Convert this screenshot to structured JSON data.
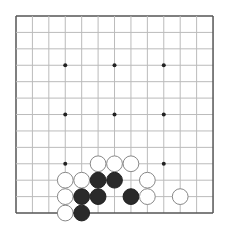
{
  "board": {
    "size": 13,
    "origin": {
      "x": 16,
      "y": 16
    },
    "spacing": 16.42,
    "line_color": "#bbbbbb",
    "border_color": "#555555",
    "star_points": [
      [
        3,
        3
      ],
      [
        6,
        3
      ],
      [
        9,
        3
      ],
      [
        3,
        6
      ],
      [
        6,
        6
      ],
      [
        9,
        6
      ],
      [
        3,
        9
      ],
      [
        6,
        9
      ],
      [
        9,
        9
      ]
    ],
    "stones": [
      {
        "color": "white",
        "col": 5,
        "row": 9
      },
      {
        "color": "white",
        "col": 6,
        "row": 9
      },
      {
        "color": "white",
        "col": 7,
        "row": 9
      },
      {
        "color": "white",
        "col": 3,
        "row": 10
      },
      {
        "color": "white",
        "col": 4,
        "row": 10
      },
      {
        "color": "black",
        "col": 5,
        "row": 10
      },
      {
        "color": "black",
        "col": 6,
        "row": 10
      },
      {
        "color": "white",
        "col": 8,
        "row": 10
      },
      {
        "color": "white",
        "col": 3,
        "row": 11
      },
      {
        "color": "black",
        "col": 4,
        "row": 11
      },
      {
        "color": "black",
        "col": 5,
        "row": 11
      },
      {
        "color": "black",
        "col": 7,
        "row": 11
      },
      {
        "color": "white",
        "col": 8,
        "row": 11
      },
      {
        "color": "white",
        "col": 10,
        "row": 11
      },
      {
        "color": "white",
        "col": 3,
        "row": 12
      },
      {
        "color": "black",
        "col": 4,
        "row": 12
      }
    ]
  }
}
